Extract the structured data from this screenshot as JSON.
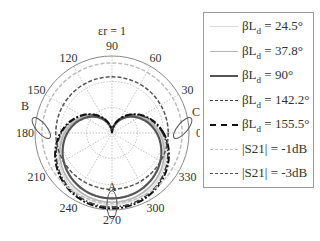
{
  "chart_data": {
    "type": "polar",
    "title": "εr = 1",
    "angle_ticks": [
      0,
      30,
      60,
      90,
      120,
      150,
      180,
      210,
      240,
      270,
      300,
      330
    ],
    "angle_tick_labels": [
      "0",
      "30",
      "60",
      "90",
      "120",
      "150",
      "180",
      "210",
      "240",
      "270",
      "300",
      "330"
    ],
    "radial_grid": [
      0.33,
      0.67,
      1.0
    ],
    "grid": true,
    "legend_position": "right",
    "annotations": [
      {
        "label": "A",
        "angle": 270,
        "note": "ellipse marker near 270°"
      },
      {
        "label": "B",
        "angle": 175,
        "note": "ellipse marker near 180°"
      },
      {
        "label": "C",
        "angle": 5,
        "note": "ellipse marker near 0°"
      }
    ],
    "series": [
      {
        "name": "βLd = 24.5°",
        "label_main": "βL",
        "label_sub": "d",
        "label_tail": " = 24.5°",
        "color": "#d9d9d9",
        "dash": "",
        "width": 1.2,
        "shape": "cardioid",
        "rmax": 0.93,
        "rmin_at_90": 0.0
      },
      {
        "name": "βLd = 37.8°",
        "label_main": "βL",
        "label_sub": "d",
        "label_tail": " = 37.8°",
        "color": "#b5b5b5",
        "dash": "",
        "width": 1.8,
        "shape": "cardioid",
        "rmax": 0.9,
        "rmin_at_90": 0.0
      },
      {
        "name": "βLd = 90°",
        "label_main": "βL",
        "label_sub": "d",
        "label_tail": " = 90°",
        "color": "#555555",
        "dash": "",
        "width": 2.2,
        "shape": "cardioid",
        "rmax": 0.85,
        "rmin_at_90": 0.0
      },
      {
        "name": "βLd = 142.2°",
        "label_main": "βL",
        "label_sub": "d",
        "label_tail": " = 142.2°",
        "color": "#444444",
        "dash": "6 2 1.5 2",
        "width": 1.6,
        "shape": "cardioid",
        "rmax": 0.96,
        "rmin_at_90": 0.0
      },
      {
        "name": "βLd = 155.5°",
        "label_main": "βL",
        "label_sub": "d",
        "label_tail": " = 155.5°",
        "color": "#111111",
        "dash": "7 2 2 2",
        "width": 2.0,
        "shape": "cardioid",
        "rmax": 0.98,
        "rmin_at_90": 0.0
      },
      {
        "name": "|S21| = -1dB",
        "label_main": "|S21| = -1dB",
        "label_sub": "",
        "label_tail": "",
        "color": "#bdbdbd",
        "dash": "4 2",
        "width": 1.5,
        "shape": "circle",
        "r": 0.91
      },
      {
        "name": "|S21| = -3dB",
        "label_main": "|S21| = -3dB",
        "label_sub": "",
        "label_tail": "",
        "color": "#555555",
        "dash": "4 2",
        "width": 1.5,
        "shape": "circle",
        "r": 0.73
      }
    ]
  },
  "geometry": {
    "cx": 112,
    "cy": 133,
    "R": 77
  }
}
